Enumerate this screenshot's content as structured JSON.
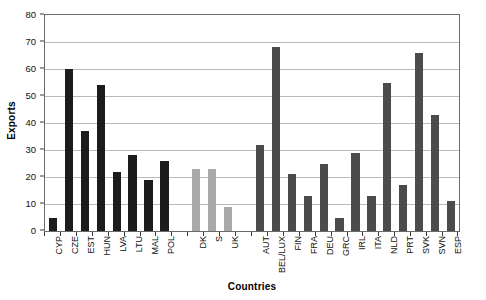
{
  "chart_data": {
    "type": "bar",
    "title": "",
    "xlabel": "Countries",
    "ylabel": "Exports",
    "ylim": [
      0,
      80
    ],
    "ytick_step": 10,
    "yticks": [
      0,
      10,
      20,
      30,
      40,
      50,
      60,
      70,
      80
    ],
    "grid": true,
    "legend": "none",
    "categories": [
      "CYP",
      "CZE",
      "EST",
      "HUN",
      "LVA",
      "LTU",
      "MAL",
      "POL",
      "DK",
      "S",
      "UK",
      "AUT",
      "BEL/LUX",
      "FIN",
      "FRA",
      "DEU",
      "GRC",
      "IRL",
      "ITA",
      "NLD",
      "PRT",
      "SVK",
      "SVN",
      "ESP"
    ],
    "values": [
      5,
      60,
      37,
      54,
      22,
      28,
      19,
      26,
      23,
      23,
      9,
      32,
      68,
      21,
      13,
      25,
      5,
      29,
      13,
      55,
      17,
      66,
      43,
      11
    ],
    "groups": [
      {
        "name": "new-member-states",
        "color": "#1c1c1c",
        "categories": [
          "CYP",
          "CZE",
          "EST",
          "HUN",
          "LVA",
          "LTU",
          "MAL",
          "POL"
        ],
        "values": [
          5,
          60,
          37,
          54,
          22,
          28,
          19,
          26
        ]
      },
      {
        "name": "non-euro-eu",
        "color": "#a9a9a9",
        "categories": [
          "DK",
          "S",
          "UK"
        ],
        "values": [
          23,
          23,
          9
        ]
      },
      {
        "name": "euro-area",
        "color": "#4b4b4b",
        "categories": [
          "AUT",
          "BEL/LUX",
          "FIN",
          "FRA",
          "DEU",
          "GRC",
          "IRL",
          "ITA",
          "NLD",
          "PRT",
          "SVK",
          "SVN",
          "ESP"
        ],
        "values": [
          32,
          68,
          21,
          13,
          25,
          5,
          29,
          13,
          55,
          17,
          66,
          43,
          11
        ]
      }
    ],
    "gaps_after": [
      "POL",
      "UK"
    ],
    "colors": {
      "group1": "#1c1c1c",
      "group2": "#a9a9a9",
      "group3": "#4b4b4b",
      "gridline": "#b9b9b9",
      "axis": "#6b6b6b",
      "text": "#111111",
      "background": "#ffffff"
    }
  }
}
